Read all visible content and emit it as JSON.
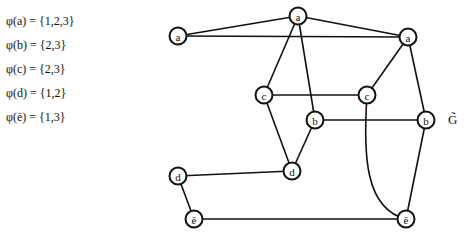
{
  "legend": {
    "rows": [
      "φ(a) = {1,2,3}",
      "φ(b) = {2,3}",
      "φ(c) = {2,3}",
      "φ(d) = {1,2}",
      "φ(ē) = {1,3}"
    ]
  },
  "graph": {
    "label": "G̃",
    "nodes": [
      {
        "id": "a_top",
        "label": "a",
        "x": 298,
        "y": 16
      },
      {
        "id": "a_left",
        "label": "a",
        "x": 178,
        "y": 36
      },
      {
        "id": "a_right",
        "label": "a",
        "x": 408,
        "y": 37
      },
      {
        "id": "c_left",
        "label": "c",
        "x": 264,
        "y": 95
      },
      {
        "id": "c_right",
        "label": "c",
        "x": 367,
        "y": 95
      },
      {
        "id": "b_left",
        "label": "b",
        "x": 315,
        "y": 120
      },
      {
        "id": "b_right",
        "label": "b",
        "x": 426,
        "y": 120
      },
      {
        "id": "d_mid",
        "label": "d",
        "x": 292,
        "y": 171
      },
      {
        "id": "d_left",
        "label": "d",
        "x": 178,
        "y": 176
      },
      {
        "id": "e_left",
        "label": "ē",
        "x": 194,
        "y": 219
      },
      {
        "id": "e_right",
        "label": "ē",
        "x": 406,
        "y": 219
      }
    ],
    "edges": [
      [
        "a_left",
        "a_top"
      ],
      [
        "a_top",
        "a_right"
      ],
      [
        "a_left",
        "a_right"
      ],
      [
        "a_top",
        "c_left"
      ],
      [
        "a_top",
        "b_left"
      ],
      [
        "a_right",
        "c_right"
      ],
      [
        "a_right",
        "b_right"
      ],
      [
        "c_left",
        "c_right"
      ],
      [
        "c_left",
        "d_mid"
      ],
      [
        "b_left",
        "b_right"
      ],
      [
        "b_left",
        "d_mid"
      ],
      [
        "d_mid",
        "d_left"
      ],
      [
        "d_left",
        "e_left"
      ],
      [
        "e_left",
        "e_right"
      ],
      [
        "c_right",
        "e_right",
        "curve"
      ],
      [
        "b_right",
        "e_right"
      ]
    ]
  }
}
